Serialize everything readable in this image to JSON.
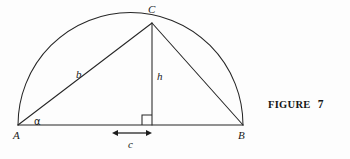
{
  "figure": {
    "caption_word": "FIGURE",
    "caption_number": "7",
    "background_color": "#fdfdfd",
    "stroke_color": "#262626"
  },
  "diagram": {
    "type": "geometry-semicircle-right-triangle",
    "vertices": [
      {
        "name": "A",
        "label": "A",
        "x": 18,
        "y": 125,
        "label_x": 13,
        "label_y": 130
      },
      {
        "name": "B",
        "label": "B",
        "x": 243,
        "y": 125,
        "label_x": 238,
        "label_y": 130
      },
      {
        "name": "C",
        "label": "C",
        "x": 152,
        "y": 23,
        "label_x": 148,
        "label_y": 4
      }
    ],
    "foot_of_altitude": {
      "name": "D",
      "x": 152,
      "y": 125
    },
    "semicircle": {
      "center_x": 130.5,
      "center_y": 125,
      "radius": 112.5,
      "start_x": 18,
      "start_y": 125,
      "end_x": 243,
      "end_y": 125
    },
    "segments": [
      {
        "name": "base-AB",
        "x1": 18,
        "y1": 125,
        "x2": 243,
        "y2": 125
      },
      {
        "name": "side-AC",
        "x1": 18,
        "y1": 125,
        "x2": 152,
        "y2": 23
      },
      {
        "name": "side-CB",
        "x1": 152,
        "y1": 23,
        "x2": 243,
        "y2": 125
      },
      {
        "name": "altitude-CD",
        "x1": 152,
        "y1": 23,
        "x2": 152,
        "y2": 125
      }
    ],
    "right_angle_marker": {
      "x": 142,
      "y": 115,
      "size": 10,
      "corner": "bottom-right"
    },
    "angle_marker": {
      "label": "α",
      "at_vertex": "A",
      "label_x": 34,
      "label_y": 117
    },
    "dimension_arrow": {
      "name": "c-dimension",
      "x1": 112,
      "x2": 152,
      "y": 133,
      "double_headed": true
    },
    "labels": [
      {
        "name": "side-b-label",
        "text": "b",
        "x": 76,
        "y": 69
      },
      {
        "name": "altitude-h-label",
        "text": "h",
        "x": 157,
        "y": 71
      },
      {
        "name": "offset-c-label",
        "text": "c",
        "x": 128,
        "y": 139
      }
    ]
  }
}
